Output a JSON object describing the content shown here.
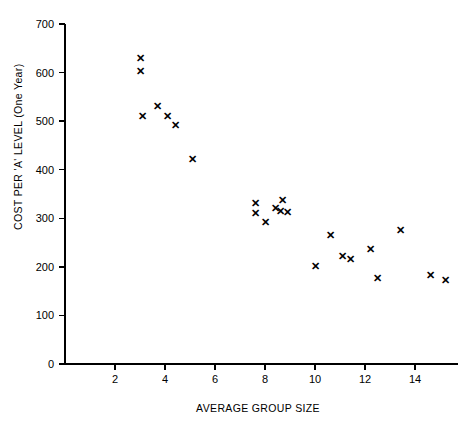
{
  "chart_data": {
    "type": "scatter",
    "title": "",
    "xlabel": "AVERAGE GROUP SIZE",
    "ylabel": "COST PER 'A' LEVEL (One Year)",
    "xlim": [
      0,
      15.7
    ],
    "ylim": [
      0,
      700
    ],
    "grid": false,
    "legend": null,
    "marker": "x",
    "marker_color": "#000000",
    "xticks": [
      2,
      4,
      6,
      8,
      10,
      12,
      14
    ],
    "xtick_labels": [
      "2",
      "4",
      "6",
      "8",
      "10",
      "12",
      "14"
    ],
    "yticks": [
      0,
      100,
      200,
      300,
      400,
      500,
      600,
      700
    ],
    "ytick_labels": [
      "0",
      "100",
      "200",
      "300",
      "400",
      "500",
      "600",
      "700"
    ],
    "points": [
      {
        "x": 3.0,
        "y": 631
      },
      {
        "x": 3.0,
        "y": 603
      },
      {
        "x": 3.1,
        "y": 511
      },
      {
        "x": 3.7,
        "y": 531
      },
      {
        "x": 4.1,
        "y": 511
      },
      {
        "x": 4.4,
        "y": 493
      },
      {
        "x": 5.1,
        "y": 423
      },
      {
        "x": 7.6,
        "y": 331
      },
      {
        "x": 7.6,
        "y": 310
      },
      {
        "x": 8.0,
        "y": 293
      },
      {
        "x": 8.4,
        "y": 321
      },
      {
        "x": 8.6,
        "y": 315
      },
      {
        "x": 8.7,
        "y": 337
      },
      {
        "x": 8.9,
        "y": 312
      },
      {
        "x": 10.0,
        "y": 202
      },
      {
        "x": 10.6,
        "y": 266
      },
      {
        "x": 11.1,
        "y": 222
      },
      {
        "x": 11.4,
        "y": 216
      },
      {
        "x": 12.2,
        "y": 236
      },
      {
        "x": 12.5,
        "y": 178
      },
      {
        "x": 13.4,
        "y": 275
      },
      {
        "x": 14.6,
        "y": 184
      },
      {
        "x": 15.2,
        "y": 172
      }
    ]
  }
}
